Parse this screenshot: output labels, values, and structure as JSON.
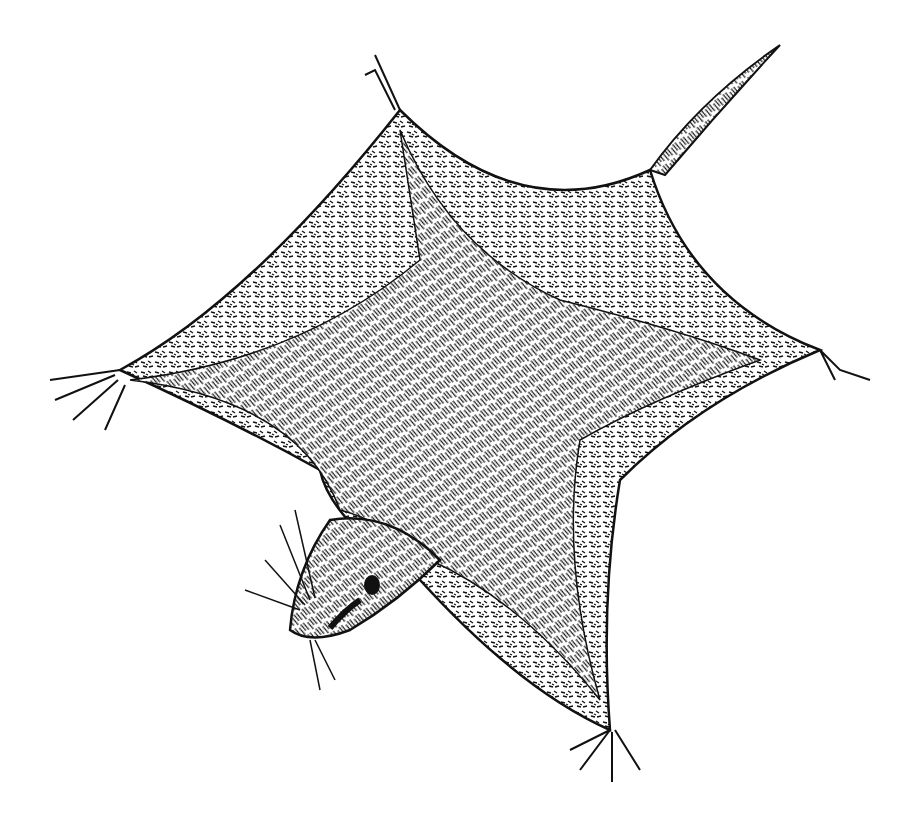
{
  "image": {
    "subject": "flying squirrel (sugar glider) pen-and-ink illustration",
    "style": "black ink hatching on white",
    "colors": {
      "ink": "#111111",
      "background": "#ffffff"
    }
  }
}
